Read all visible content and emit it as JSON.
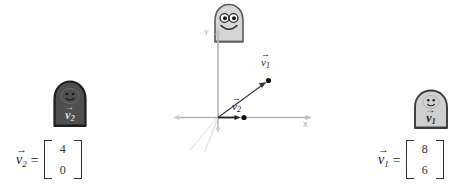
{
  "figure": {
    "background_color": "#ffffff"
  },
  "plot": {
    "axis_labels": {
      "x": "X",
      "y": "Y"
    },
    "axis_color": "#b6b6b6",
    "vector_color": "#3a3a3a",
    "guide_line_color": "#e2e2e2",
    "vectors": [
      {
        "name": "v1",
        "label": "v",
        "subscript": "1",
        "components": [
          8,
          6
        ],
        "label_position": "above-right of tip"
      },
      {
        "name": "v2",
        "label": "v",
        "subscript": "2",
        "components": [
          4,
          0
        ],
        "label_position": "above tip"
      }
    ]
  },
  "equations": [
    {
      "id": "equation-v2",
      "lhs_symbol": "v",
      "lhs_subscript": "2",
      "equals": "=",
      "values": [
        "4",
        "0"
      ]
    },
    {
      "id": "equation-v1",
      "lhs_symbol": "v",
      "lhs_subscript": "1",
      "equals": "=",
      "values": [
        "8",
        "6"
      ]
    }
  ],
  "characters": [
    {
      "id": "character-v2",
      "label": "v",
      "subscript": "2",
      "body_color": "#4f4f4f",
      "outline_color": "#1f1f1f",
      "text_color": "#dcdcdc",
      "expression": "smile",
      "eyes": "two-dots",
      "position": "left"
    },
    {
      "id": "character-center",
      "label": "",
      "subscript": "",
      "body_color": "#d6d6d6",
      "outline_color": "#5a5a5a",
      "text_color": "#222222",
      "expression": "big-smile",
      "eyes": "two-large-round-eyes",
      "position": "center-top"
    },
    {
      "id": "character-v1",
      "label": "v",
      "subscript": "1",
      "body_color": "#cfcfcf",
      "outline_color": "#3a3a3a",
      "text_color": "#1c1c1c",
      "expression": "smile",
      "eyes": "two-dots",
      "position": "right"
    }
  ]
}
